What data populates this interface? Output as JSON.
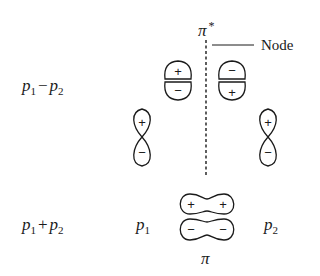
{
  "diagram": {
    "labels": {
      "antibonding_mo": "π",
      "antibonding_star": "*",
      "bonding_mo": "π",
      "node": "Node",
      "combo_minus": {
        "a": "p",
        "a_sub": "1",
        "op": "−",
        "b": "p",
        "b_sub": "2"
      },
      "combo_plus": {
        "a": "p",
        "a_sub": "1",
        "op": "+",
        "b": "p",
        "b_sub": "2"
      },
      "atom_left": {
        "base": "p",
        "sub": "1"
      },
      "atom_right": {
        "base": "p",
        "sub": "2"
      }
    },
    "antibonding_lobes": {
      "left": {
        "top_sign": "+",
        "bottom_sign": "−"
      },
      "right": {
        "top_sign": "−",
        "bottom_sign": "+"
      }
    },
    "atomic_orbitals": {
      "left": {
        "top_sign": "+",
        "bottom_sign": "−"
      },
      "right": {
        "top_sign": "+",
        "bottom_sign": "−"
      }
    },
    "bonding_lobes": {
      "top": {
        "left_sign": "+",
        "right_sign": "+"
      },
      "bottom": {
        "left_sign": "−",
        "right_sign": "−"
      }
    },
    "colors": {
      "ink": "#1a1a1a",
      "background": "#ffffff"
    }
  }
}
